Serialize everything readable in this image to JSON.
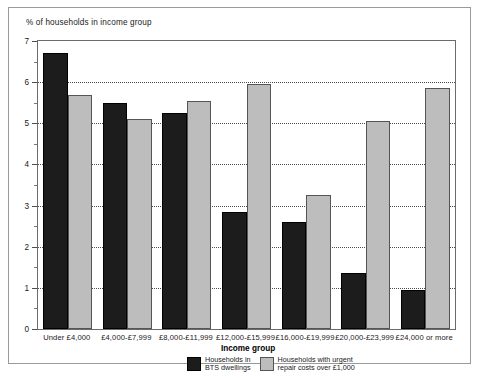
{
  "chart_data": {
    "type": "bar",
    "title": "% of households in income group",
    "xlabel": "Income group",
    "ylabel": "% of households in income group",
    "ylim": [
      0,
      7
    ],
    "ytick_labels": [
      "0",
      "1",
      "2",
      "3",
      "4",
      "5",
      "6",
      "7"
    ],
    "ytick_values": [
      0,
      1,
      2,
      3,
      4,
      5,
      6,
      7
    ],
    "minor_tick_interval": 0.5,
    "grid": "horizontal dotted at integer values",
    "legend_position": "below-axis-center",
    "categories": [
      "Under £4,000",
      "£4,000-£7,999",
      "£8,000-£11,999",
      "£12,000-£15,999",
      "£16,000-£19,999",
      "£20,000-£23,999",
      "£24,000 or more"
    ],
    "series": [
      {
        "name": "Households in\nBTS dwellings",
        "color": "#1c1c1c",
        "values": [
          6.7,
          5.5,
          5.25,
          2.85,
          2.6,
          1.35,
          0.95
        ]
      },
      {
        "name": "Households with urgent\nrepair costs over £1,000",
        "color": "#bdbdbd",
        "values": [
          5.7,
          5.1,
          5.55,
          5.95,
          3.25,
          5.05,
          5.85
        ]
      }
    ]
  },
  "legend": {
    "items": [
      {
        "label": "Households in\nBTS dwellings",
        "swatch": "dark"
      },
      {
        "label": "Households with urgent\nrepair costs over £1,000",
        "swatch": "light"
      }
    ]
  }
}
